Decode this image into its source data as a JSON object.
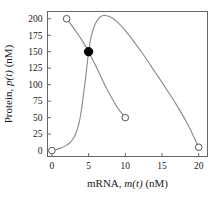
{
  "chart_data": {
    "type": "line",
    "title": "",
    "subtitle": "",
    "xlabel": "mRNA, m(t) (nM)",
    "xlabel_prefix": "mRNA, ",
    "xlabel_italic": "m(t)",
    "xlabel_suffix": " (nM)",
    "ylabel": "Protein, p(t) (nM)",
    "ylabel_prefix": "Protein, ",
    "ylabel_italic": "p(t)",
    "ylabel_suffix": " (nM)",
    "xlim": [
      -0.6,
      21.2
    ],
    "ylim": [
      -9,
      211
    ],
    "xticks": [
      0,
      5,
      10,
      15,
      20
    ],
    "xtick_labels": [
      "0",
      "5",
      "10",
      "15",
      "20"
    ],
    "yticks": [
      0,
      25,
      50,
      75,
      100,
      125,
      150,
      175,
      200
    ],
    "ytick_labels": [
      "0",
      "25",
      "50",
      "75",
      "100",
      "125",
      "150",
      "175",
      "200"
    ],
    "grid": false,
    "legend": false,
    "legend_position": "none",
    "line_color": "#8c8c8c",
    "marker_edge_color": "#555555",
    "marker_open_fill": "#ffffff",
    "marker_filled_color": "#000000",
    "frame_color": "#666666",
    "background_color": "#ffffff",
    "series": [
      {
        "name": "sigmoidal-nullcline",
        "style": "solid",
        "color": "#8c8c8c",
        "x": [
          0.0,
          0.4,
          0.9,
          1.4,
          1.9,
          2.4,
          2.9,
          3.3,
          3.7,
          4.0,
          4.3,
          4.55,
          4.75,
          4.9,
          5.0,
          5.15,
          5.35,
          5.6,
          5.9,
          6.2,
          6.6,
          7.0,
          7.5,
          8.2,
          9.0,
          10.0,
          11.2,
          12.5,
          14.0,
          15.5,
          17.0,
          18.5,
          20.0
        ],
        "y": [
          0.0,
          1.0,
          2.5,
          4.5,
          7.5,
          11.5,
          18.0,
          27.0,
          42.0,
          60.0,
          85.0,
          106.0,
          126.0,
          141.0,
          150.0,
          161.0,
          173.0,
          183.0,
          192.0,
          198.0,
          203.0,
          205.0,
          204.5,
          201.0,
          194.0,
          182.0,
          165.0,
          145.0,
          120.0,
          95.0,
          69.0,
          40.0,
          5.0
        ]
      },
      {
        "name": "descending-nullcline",
        "style": "solid",
        "color": "#8c8c8c",
        "x": [
          2.0,
          2.5,
          3.0,
          3.5,
          4.0,
          4.5,
          5.0,
          5.5,
          6.0,
          6.6,
          7.2,
          7.8,
          8.4,
          9.0,
          9.5,
          10.0
        ],
        "y": [
          200.0,
          193.0,
          185.0,
          177.0,
          169.0,
          160.0,
          150.0,
          139.0,
          128.0,
          114.0,
          100.0,
          87.0,
          75.0,
          64.0,
          57.0,
          50.0
        ]
      }
    ],
    "markers": [
      {
        "name": "open-marker-origin",
        "x": 0,
        "y": 0,
        "filled": false
      },
      {
        "name": "open-marker-top-left",
        "x": 2,
        "y": 200,
        "filled": false
      },
      {
        "name": "open-marker-mid-right",
        "x": 10,
        "y": 50,
        "filled": false
      },
      {
        "name": "open-marker-bottom-right",
        "x": 20,
        "y": 5,
        "filled": false
      },
      {
        "name": "fixed-point-marker",
        "x": 5,
        "y": 150,
        "filled": true
      }
    ],
    "annotations": []
  }
}
